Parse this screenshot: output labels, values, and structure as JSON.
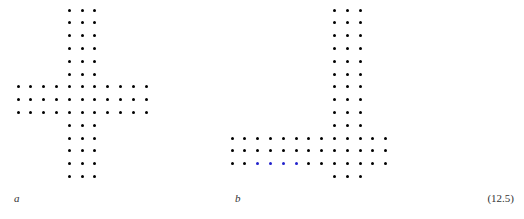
{
  "figure": {
    "equation_number": "(12.5)",
    "dot_radius_px": 1.5,
    "colors": {
      "dot_black": "#000000",
      "dot_blue": "#2222cc",
      "background": "#ffffff",
      "label_text": "#333333"
    },
    "panels": [
      {
        "id": "a",
        "label": "a",
        "shape": "plus-cross lattice",
        "origin_x": 18,
        "origin_y": 10,
        "spacing_x": 12.8,
        "spacing_y": 12.8,
        "grid_cols": 14,
        "grid_rows": 14,
        "vertical_arm_cols": [
          4,
          5,
          6
        ],
        "horizontal_arm_rows": [
          6,
          7,
          8
        ],
        "cells": [
          [
            4,
            0
          ],
          [
            5,
            0
          ],
          [
            6,
            0
          ],
          [
            4,
            1
          ],
          [
            5,
            1
          ],
          [
            6,
            1
          ],
          [
            4,
            2
          ],
          [
            5,
            2
          ],
          [
            6,
            2
          ],
          [
            4,
            3
          ],
          [
            5,
            3
          ],
          [
            6,
            3
          ],
          [
            4,
            4
          ],
          [
            5,
            4
          ],
          [
            6,
            4
          ],
          [
            4,
            5
          ],
          [
            5,
            5
          ],
          [
            6,
            5
          ],
          [
            0,
            6
          ],
          [
            1,
            6
          ],
          [
            2,
            6
          ],
          [
            3,
            6
          ],
          [
            4,
            6
          ],
          [
            5,
            6
          ],
          [
            6,
            6
          ],
          [
            7,
            6
          ],
          [
            8,
            6
          ],
          [
            9,
            6
          ],
          [
            10,
            6
          ],
          [
            0,
            7
          ],
          [
            1,
            7
          ],
          [
            2,
            7
          ],
          [
            3,
            7
          ],
          [
            4,
            7
          ],
          [
            5,
            7
          ],
          [
            6,
            7
          ],
          [
            7,
            7
          ],
          [
            8,
            7
          ],
          [
            9,
            7
          ],
          [
            10,
            7
          ],
          [
            0,
            8
          ],
          [
            1,
            8
          ],
          [
            2,
            8
          ],
          [
            3,
            8
          ],
          [
            4,
            8
          ],
          [
            5,
            8
          ],
          [
            6,
            8
          ],
          [
            7,
            8
          ],
          [
            8,
            8
          ],
          [
            9,
            8
          ],
          [
            10,
            8
          ],
          [
            4,
            9
          ],
          [
            5,
            9
          ],
          [
            6,
            9
          ],
          [
            4,
            10
          ],
          [
            5,
            10
          ],
          [
            6,
            10
          ],
          [
            4,
            11
          ],
          [
            5,
            11
          ],
          [
            6,
            11
          ],
          [
            4,
            12
          ],
          [
            5,
            12
          ],
          [
            6,
            12
          ],
          [
            4,
            13
          ],
          [
            5,
            13
          ],
          [
            6,
            13
          ]
        ],
        "blue_cells": []
      },
      {
        "id": "b",
        "label": "b",
        "shape": "offset cross lattice with highlighted row segment",
        "origin_x": 232,
        "origin_y": 10,
        "spacing_x": 12.8,
        "spacing_y": 12.8,
        "grid_cols": 14,
        "grid_rows": 14,
        "vertical_arm_cols": [
          8,
          9,
          10
        ],
        "horizontal_arm_rows": [
          10,
          11,
          12
        ],
        "cells": [
          [
            8,
            0
          ],
          [
            9,
            0
          ],
          [
            10,
            0
          ],
          [
            8,
            1
          ],
          [
            9,
            1
          ],
          [
            10,
            1
          ],
          [
            8,
            2
          ],
          [
            9,
            2
          ],
          [
            10,
            2
          ],
          [
            8,
            3
          ],
          [
            9,
            3
          ],
          [
            10,
            3
          ],
          [
            8,
            4
          ],
          [
            9,
            4
          ],
          [
            10,
            4
          ],
          [
            8,
            5
          ],
          [
            9,
            5
          ],
          [
            10,
            5
          ],
          [
            8,
            6
          ],
          [
            9,
            6
          ],
          [
            10,
            6
          ],
          [
            8,
            7
          ],
          [
            9,
            7
          ],
          [
            10,
            7
          ],
          [
            8,
            8
          ],
          [
            9,
            8
          ],
          [
            10,
            8
          ],
          [
            8,
            9
          ],
          [
            9,
            9
          ],
          [
            10,
            9
          ],
          [
            0,
            10
          ],
          [
            1,
            10
          ],
          [
            2,
            10
          ],
          [
            3,
            10
          ],
          [
            4,
            10
          ],
          [
            5,
            10
          ],
          [
            6,
            10
          ],
          [
            7,
            10
          ],
          [
            8,
            10
          ],
          [
            9,
            10
          ],
          [
            10,
            10
          ],
          [
            11,
            10
          ],
          [
            12,
            10
          ],
          [
            0,
            11
          ],
          [
            1,
            11
          ],
          [
            2,
            11
          ],
          [
            3,
            11
          ],
          [
            4,
            11
          ],
          [
            5,
            11
          ],
          [
            6,
            11
          ],
          [
            7,
            11
          ],
          [
            8,
            11
          ],
          [
            9,
            11
          ],
          [
            10,
            11
          ],
          [
            11,
            11
          ],
          [
            12,
            11
          ],
          [
            0,
            12
          ],
          [
            1,
            12
          ],
          [
            2,
            12
          ],
          [
            3,
            12
          ],
          [
            4,
            12
          ],
          [
            5,
            12
          ],
          [
            6,
            12
          ],
          [
            7,
            12
          ],
          [
            8,
            12
          ],
          [
            9,
            12
          ],
          [
            10,
            12
          ],
          [
            11,
            12
          ],
          [
            12,
            12
          ],
          [
            8,
            13
          ],
          [
            9,
            13
          ],
          [
            10,
            13
          ]
        ],
        "blue_cells": [
          [
            2,
            12
          ],
          [
            3,
            12
          ],
          [
            4,
            12
          ],
          [
            5,
            12
          ]
        ]
      }
    ]
  }
}
